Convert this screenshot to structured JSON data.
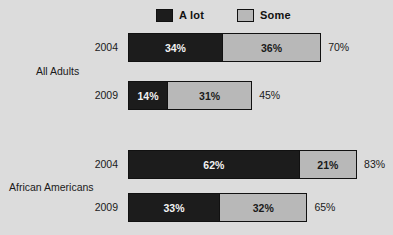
{
  "chart_data": {
    "type": "bar",
    "orientation": "horizontal",
    "stacked": true,
    "title": "",
    "subtitle": "",
    "xlabel": "",
    "ylabel": "",
    "grid": false,
    "legend_position": "top",
    "xlim": [
      0,
      100
    ],
    "axis_unit": "%",
    "series": [
      {
        "name": "A lot",
        "color": "#1c1c1c",
        "values": [
          34,
          14,
          62,
          33
        ]
      },
      {
        "name": "Some",
        "color": "#b8b8b8",
        "values": [
          36,
          31,
          21,
          32
        ]
      }
    ],
    "groups": [
      {
        "label": "All Adults",
        "rows": [
          0,
          1
        ]
      },
      {
        "label": "African Americans",
        "rows": [
          2,
          3
        ]
      }
    ],
    "categories": [
      "2004",
      "2009",
      "2004",
      "2009"
    ],
    "totals": [
      70,
      45,
      83,
      65
    ]
  },
  "legend": {
    "items": [
      {
        "label": "A lot",
        "color": "#1c1c1c",
        "swatch_icon": "legend-swatch-dark"
      },
      {
        "label": "Some",
        "color": "#b8b8b8",
        "swatch_icon": "legend-swatch-light"
      }
    ]
  },
  "groups": [
    {
      "label": "All Adults"
    },
    {
      "label": "African Americans"
    }
  ],
  "rows": [
    {
      "year": "2004",
      "alot_label": "34%",
      "some_label": "36%",
      "total_label": "70%",
      "alot": 34,
      "some": 36,
      "total": 70
    },
    {
      "year": "2009",
      "alot_label": "14%",
      "some_label": "31%",
      "total_label": "45%",
      "alot": 14,
      "some": 31,
      "total": 45
    },
    {
      "year": "2004",
      "alot_label": "62%",
      "some_label": "21%",
      "total_label": "83%",
      "alot": 62,
      "some": 21,
      "total": 83
    },
    {
      "year": "2009",
      "alot_label": "33%",
      "some_label": "32%",
      "total_label": "65%",
      "alot": 33,
      "some": 32,
      "total": 65
    }
  ],
  "colors": {
    "background": "#dcdcdc",
    "alot": "#1c1c1c",
    "some": "#b8b8b8",
    "outline": "#111111",
    "text": "#1a1a1a"
  },
  "layout": {
    "bar_left_px": 128,
    "px_per_percent": 2.76,
    "total_gap_px": 7
  }
}
